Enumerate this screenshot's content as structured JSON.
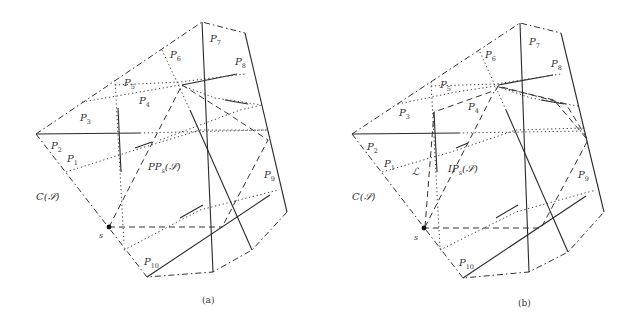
{
  "figure": {
    "panels": [
      {
        "id": "a",
        "caption": "(a)",
        "region_label": "PP",
        "region_label_sub": "s",
        "region_label_arg": "(𝒮)",
        "hull_label": "C(𝒮)",
        "source_label": "s",
        "obstacle_labels": [
          {
            "name": "P",
            "sub": "1"
          },
          {
            "name": "P",
            "sub": "2"
          },
          {
            "name": "P",
            "sub": "3"
          },
          {
            "name": "P",
            "sub": "4"
          },
          {
            "name": "P",
            "sub": "5"
          },
          {
            "name": "P",
            "sub": "6"
          },
          {
            "name": "P",
            "sub": "7"
          },
          {
            "name": "P",
            "sub": "8"
          },
          {
            "name": "P",
            "sub": "9"
          },
          {
            "name": "P",
            "sub": "10"
          }
        ]
      },
      {
        "id": "b",
        "caption": "(b)",
        "region_label": "IP",
        "region_label_sub": "s",
        "region_label_arg": "(𝒮)",
        "hull_label": "C(𝒮)",
        "source_label": "s",
        "extra_label": "ℒ",
        "obstacle_labels": [
          {
            "name": "P",
            "sub": "1"
          },
          {
            "name": "P",
            "sub": "2"
          },
          {
            "name": "P",
            "sub": "3"
          },
          {
            "name": "P",
            "sub": "4"
          },
          {
            "name": "P",
            "sub": "5"
          },
          {
            "name": "P",
            "sub": "6"
          },
          {
            "name": "P",
            "sub": "7"
          },
          {
            "name": "P",
            "sub": "8"
          },
          {
            "name": "P",
            "sub": "9"
          },
          {
            "name": "P",
            "sub": "10"
          }
        ]
      }
    ]
  }
}
